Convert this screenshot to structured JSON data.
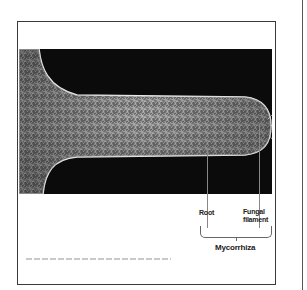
{
  "figure": {
    "labels": {
      "root": "Root",
      "fungal_filament_line1": "Fungal",
      "fungal_filament_line2": "filament",
      "bracket_label": "Mycorrhiza"
    },
    "colors": {
      "background": "#0b0b0b",
      "root_tissue": "#cfcfcf",
      "text": "#222222",
      "frame": "#3a3a3a"
    }
  }
}
